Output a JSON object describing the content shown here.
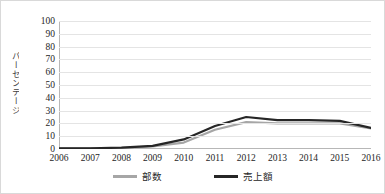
{
  "chart_data": {
    "type": "line",
    "title": "",
    "xlabel": "",
    "ylabel": "パーセンテージ",
    "categories": [
      "2006",
      "2007",
      "2008",
      "2009",
      "2010",
      "2011",
      "2012",
      "2013",
      "2014",
      "2015",
      "2016"
    ],
    "ylim": [
      0,
      100
    ],
    "yticks": [
      0,
      10,
      20,
      30,
      40,
      50,
      60,
      70,
      80,
      90,
      100
    ],
    "grid": true,
    "legend_position": "bottom",
    "series": [
      {
        "name": "部数",
        "color": "#a6a6a6",
        "values": [
          0.5,
          0.5,
          0.8,
          2.0,
          5.0,
          15.0,
          21.0,
          20.0,
          20.0,
          20.0,
          16.0
        ]
      },
      {
        "name": "売上額",
        "color": "#262626",
        "values": [
          0.5,
          0.6,
          1.0,
          2.5,
          7.5,
          18.0,
          25.0,
          22.5,
          22.5,
          22.0,
          16.5
        ]
      }
    ]
  },
  "style": {
    "background": "#ffffff",
    "grid_color": "#e4e4e4",
    "axis_color": "#b7b7b7",
    "tick_text_color": "#262626",
    "border_color": "#d9d9d9"
  }
}
